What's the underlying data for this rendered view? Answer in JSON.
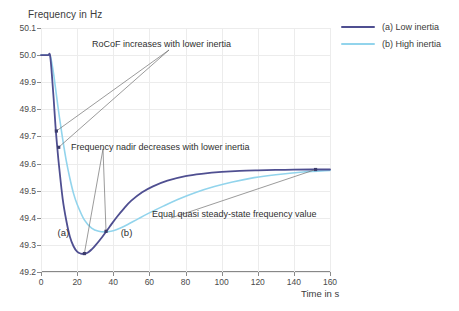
{
  "chart_data": {
    "type": "line",
    "title": "",
    "xlabel": "Time in s",
    "ylabel": "Frequency in Hz",
    "xlim": [
      0,
      160
    ],
    "ylim": [
      49.2,
      50.1
    ],
    "grid": true,
    "legend_position": "top-right",
    "xticks": [
      "0",
      "20",
      "40",
      "60",
      "80",
      "100",
      "120",
      "140",
      "160"
    ],
    "xtick_values": [
      0,
      20,
      40,
      60,
      80,
      100,
      120,
      140,
      160
    ],
    "yticks": [
      "50.1",
      "50.0",
      "49.9",
      "49.8",
      "49.7",
      "49.6",
      "49.5",
      "49.4",
      "49.3",
      "49.2"
    ],
    "ytick_values": [
      50.1,
      50.0,
      49.9,
      49.8,
      49.7,
      49.6,
      49.5,
      49.4,
      49.3,
      49.2
    ],
    "series": [
      {
        "name": "(a) Low inertia",
        "color": "#4f4f91",
        "x": [
          0,
          2,
          4,
          5,
          6,
          7,
          8,
          9,
          10,
          12,
          14,
          16,
          18,
          20,
          22,
          24,
          26,
          28,
          30,
          34,
          38,
          42,
          46,
          50,
          56,
          62,
          70,
          80,
          90,
          100,
          110,
          120,
          135,
          150,
          160
        ],
        "y": [
          50.0,
          50.0,
          50.0,
          50.0,
          49.93,
          49.84,
          49.74,
          49.66,
          49.59,
          49.47,
          49.39,
          49.33,
          49.295,
          49.275,
          49.268,
          49.267,
          49.272,
          49.283,
          49.297,
          49.33,
          49.367,
          49.403,
          49.435,
          49.463,
          49.494,
          49.516,
          49.537,
          49.554,
          49.563,
          49.569,
          49.573,
          49.575,
          49.577,
          49.578,
          49.578
        ]
      },
      {
        "name": "(b) High inertia",
        "color": "#92d4ec",
        "x": [
          0,
          2,
          4,
          5,
          6,
          7,
          8,
          10,
          12,
          14,
          16,
          18,
          20,
          24,
          28,
          32,
          36,
          40,
          44,
          48,
          54,
          60,
          68,
          76,
          86,
          96,
          106,
          118,
          130,
          145,
          160
        ],
        "y": [
          50.0,
          50.0,
          50.0,
          50.0,
          49.97,
          49.93,
          49.88,
          49.78,
          49.69,
          49.61,
          49.545,
          49.49,
          49.45,
          49.392,
          49.362,
          49.35,
          49.348,
          49.352,
          49.362,
          49.375,
          49.397,
          49.418,
          49.444,
          49.468,
          49.494,
          49.515,
          49.532,
          49.548,
          49.559,
          49.569,
          49.575
        ]
      }
    ],
    "annotations": [
      {
        "id": "rocof",
        "text": "RoCoF increases with lower inertia",
        "target_points": [
          [
            8.5,
            49.72
          ],
          [
            9.8,
            49.66
          ]
        ]
      },
      {
        "id": "nadir",
        "text": "Frequency nadir decreases with lower inertia",
        "target_points": [
          [
            24,
            49.268
          ],
          [
            36,
            49.35
          ]
        ]
      },
      {
        "id": "qss",
        "text": "Equal quasi steady-state frequency value",
        "target_points": [
          [
            152,
            49.578
          ]
        ]
      }
    ],
    "curve_labels": [
      {
        "text": "(a)",
        "x": 13,
        "y": 49.34
      },
      {
        "text": "(b)",
        "x": 48,
        "y": 49.34
      }
    ]
  },
  "legend": {
    "items": [
      {
        "label": "(a) Low inertia",
        "color": "#4f4f91"
      },
      {
        "label": "(b) High inertia",
        "color": "#92d4ec"
      }
    ]
  }
}
